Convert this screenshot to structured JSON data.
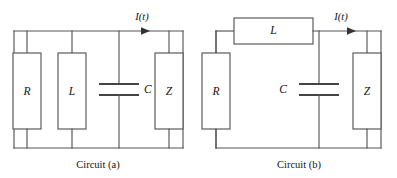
{
  "figure": {
    "background_color": "#ffffff",
    "line_color": "#555555",
    "text_color": "#111111"
  },
  "circuits": [
    {
      "id": "circuit-a",
      "caption": "Circuit (a)",
      "topology": "parallel",
      "current_label": "I(t)",
      "current_direction": "right",
      "components": [
        {
          "name": "resistor",
          "label": "R",
          "symbol": "rectangle-box",
          "orientation": "vertical"
        },
        {
          "name": "inductor",
          "label": "L",
          "symbol": "rectangle-box",
          "orientation": "vertical"
        },
        {
          "name": "capacitor",
          "label": "C",
          "symbol": "parallel-plates",
          "orientation": "vertical",
          "label_side": "right"
        },
        {
          "name": "impedance",
          "label": "Z",
          "symbol": "rectangle-box",
          "orientation": "vertical"
        }
      ]
    },
    {
      "id": "circuit-b",
      "caption": "Circuit (b)",
      "topology": "series-parallel",
      "current_label": "I(t)",
      "current_direction": "right",
      "components": [
        {
          "name": "resistor",
          "label": "R",
          "symbol": "rectangle-box",
          "orientation": "vertical"
        },
        {
          "name": "inductor",
          "label": "L",
          "symbol": "rectangle-box",
          "orientation": "horizontal"
        },
        {
          "name": "capacitor",
          "label": "C",
          "symbol": "parallel-plates",
          "orientation": "vertical",
          "label_side": "left"
        },
        {
          "name": "impedance",
          "label": "Z",
          "symbol": "rectangle-box",
          "orientation": "vertical"
        }
      ]
    }
  ]
}
